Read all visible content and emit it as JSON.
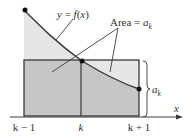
{
  "diagram": {
    "curve_label": "y = f(x)",
    "area_label_prefix": "Area = ",
    "area_label_var": "a",
    "area_label_sub": "k",
    "height_label_var": "a",
    "height_label_sub": "k",
    "axis_label": "x",
    "ticks": [
      {
        "label": "k − 1",
        "x": 24
      },
      {
        "label": "k",
        "x": 81
      },
      {
        "label": "k + 1",
        "x": 139
      }
    ],
    "colors": {
      "light_fill": "#e6e6e6",
      "dark_fill": "#c6c6c6",
      "stroke": "#3a3a3a",
      "text": "#333333"
    }
  }
}
